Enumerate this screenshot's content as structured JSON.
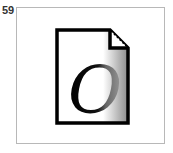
{
  "figure": {
    "number_label": "59",
    "icon": {
      "name": "document-icon",
      "glyph": "O",
      "colors": {
        "outline": "#000000",
        "fill": "#ffffff",
        "gradient_end": "#8a8a8a"
      }
    },
    "frame_border_color": "#b8b8b8"
  }
}
